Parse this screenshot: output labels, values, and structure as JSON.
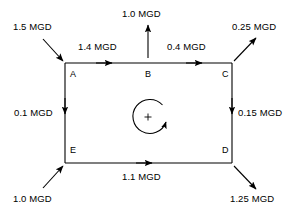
{
  "diagram": {
    "units": "MGD",
    "line_color": "#000000",
    "background_color": "#ffffff",
    "loop_sign": "+",
    "loop_direction": "clockwise",
    "nodes": [
      {
        "id": "A",
        "label": "A",
        "x": 65,
        "y": 63
      },
      {
        "id": "B",
        "label": "B",
        "x": 148,
        "y": 63
      },
      {
        "id": "C",
        "label": "C",
        "x": 232,
        "y": 63
      },
      {
        "id": "D",
        "label": "D",
        "x": 232,
        "y": 163
      },
      {
        "id": "E",
        "label": "E",
        "x": 65,
        "y": 163
      }
    ],
    "pipe_flows": [
      {
        "name": "flow-a-to-b",
        "from": "A",
        "to": "B",
        "label": "1.4 MGD",
        "value": 1.4,
        "direction": "right"
      },
      {
        "name": "flow-b-to-c",
        "from": "B",
        "to": "C",
        "label": "0.4 MGD",
        "value": 0.4,
        "direction": "right"
      },
      {
        "name": "flow-a-to-e",
        "from": "A",
        "to": "E",
        "label": "0.1 MGD",
        "value": 0.1,
        "direction": "down"
      },
      {
        "name": "flow-c-to-d",
        "from": "C",
        "to": "D",
        "label": "0.15 MGD",
        "value": 0.15,
        "direction": "down"
      },
      {
        "name": "flow-e-to-d",
        "from": "E",
        "to": "D",
        "label": "1.1 MGD",
        "value": 1.1,
        "direction": "right"
      }
    ],
    "external_flows": [
      {
        "name": "inflow-at-a",
        "node": "A",
        "label": "1.5 MGD",
        "value": 1.5,
        "type": "inflow",
        "direction": "from-upper-left"
      },
      {
        "name": "outflow-at-b",
        "node": "B",
        "label": "1.0 MGD",
        "value": 1.0,
        "type": "outflow",
        "direction": "up"
      },
      {
        "name": "outflow-at-c",
        "node": "C",
        "label": "0.25 MGD",
        "value": 0.25,
        "type": "outflow",
        "direction": "to-upper-right"
      },
      {
        "name": "inflow-at-e",
        "node": "E",
        "label": "1.0 MGD",
        "value": 1.0,
        "type": "inflow",
        "direction": "from-lower-left"
      },
      {
        "name": "outflow-at-d",
        "node": "D",
        "label": "1.25 MGD",
        "value": 1.25,
        "type": "outflow",
        "direction": "to-lower-right"
      }
    ]
  }
}
